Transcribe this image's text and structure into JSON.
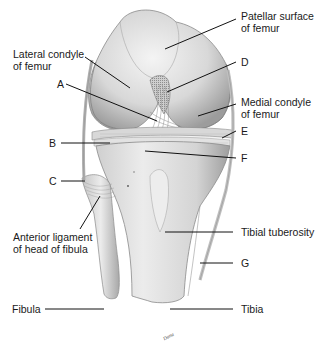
{
  "figure": {
    "signature": "Dana"
  },
  "labels": {
    "patellar_surface_line1": "Patellar surface",
    "patellar_surface_line2": "of femur",
    "lateral_condyle_line1": "Lateral condyle",
    "lateral_condyle_line2": "of femur",
    "medial_condyle_line1": "Medial condyle",
    "medial_condyle_line2": "of femur",
    "A": "A",
    "B": "B",
    "C": "C",
    "D": "D",
    "E": "E",
    "F": "F",
    "G": "G",
    "anterior_ligament_line1": "Anterior ligament",
    "anterior_ligament_line2": "of head of fibula",
    "tibial_tuberosity": "Tibial tuberosity",
    "fibula": "Fibula",
    "tibia": "Tibia"
  },
  "colors": {
    "background": "#ffffff",
    "bone_light": "#e6e6e6",
    "bone_mid": "#c8c8c8",
    "bone_dark": "#9a9a9a",
    "ligament": "#b4b4b4",
    "leader_line": "#111111",
    "text": "#1a1a1a"
  }
}
